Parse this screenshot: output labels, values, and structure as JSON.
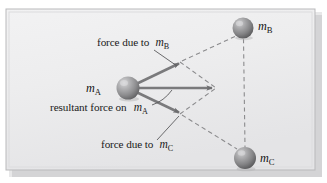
{
  "figure": {
    "kind": "physics-vector-diagram",
    "topic": "gravitational forces and resultant force on a mass",
    "panel": {
      "background_color": "#ececed",
      "border_color": "#b9b9bb",
      "shadow_color": "#c3c3c5",
      "page_background": "#ffffff"
    },
    "masses": [
      {
        "id": "mA",
        "symbol": "m",
        "subscript": "A",
        "label_side": "left",
        "cx": 128,
        "cy": 88,
        "r": 11.5,
        "color": "#8e8e90",
        "highlight_color": "#c9c9cb"
      },
      {
        "id": "mB",
        "symbol": "m",
        "subscript": "B",
        "label_side": "right",
        "cx": 243,
        "cy": 28,
        "r": 10.5,
        "color": "#878789",
        "highlight_color": "#c4c4c6"
      },
      {
        "id": "mC",
        "symbol": "m",
        "subscript": "C",
        "label_side": "right",
        "cx": 245,
        "cy": 158,
        "r": 11,
        "color": "#878789",
        "highlight_color": "#c4c4c6"
      }
    ],
    "vectors": [
      {
        "id": "force-due-to-mB",
        "from": [
          128,
          88
        ],
        "to": [
          181,
          62
        ],
        "color": "#7a7a7c",
        "description": "force on mA due to mB, pointing up and to the right toward mB"
      },
      {
        "id": "resultant-force-on-mA",
        "from": [
          128,
          88
        ],
        "to": [
          215,
          88
        ],
        "color": "#7a7a7c",
        "description": "resultant (vector sum) force on mA, horizontal to the right"
      },
      {
        "id": "force-due-to-mC",
        "from": [
          128,
          88
        ],
        "to": [
          181,
          114
        ],
        "color": "#7a7a7c",
        "description": "force on mA due to mC, pointing down and to the right toward mC"
      }
    ],
    "dashed_lines": [
      {
        "id": "parallelogram-mB-side",
        "from": [
          181,
          62
        ],
        "to": [
          215,
          88
        ],
        "color": "#8b8b8d"
      },
      {
        "id": "parallelogram-mC-side",
        "from": [
          181,
          114
        ],
        "to": [
          215,
          88
        ],
        "color": "#8b8b8d"
      },
      {
        "id": "line-of-action-to-mB",
        "from": [
          181,
          62
        ],
        "to": [
          237,
          36
        ],
        "color": "#8b8b8d"
      },
      {
        "id": "line-of-action-to-mC",
        "from": [
          181,
          114
        ],
        "to": [
          238,
          150
        ],
        "color": "#8b8b8d"
      },
      {
        "id": "connector-mB-to-mC",
        "from": [
          243,
          39
        ],
        "to": [
          245,
          147
        ],
        "color": "#8b8b8d"
      }
    ],
    "annotations": [
      {
        "id": "label-force-due-to-mB",
        "text": "force due to",
        "symbol": "m",
        "subscript": "B",
        "x": 97,
        "y": 46,
        "leader": {
          "from": [
            155,
            50
          ],
          "to": [
            176,
            64
          ]
        }
      },
      {
        "id": "label-resultant-force-on-mA",
        "text": "resultant force on",
        "symbol": "m",
        "subscript": "A",
        "x": 50,
        "y": 111,
        "leader_curve": "M 154 104 Q 166 99 173 91"
      },
      {
        "id": "label-force-due-to-mC",
        "text": "force due to",
        "symbol": "m",
        "subscript": "C",
        "x": 101,
        "y": 148,
        "leader": {
          "from": [
            158,
            140
          ],
          "to": [
            178,
            117
          ]
        }
      }
    ]
  }
}
